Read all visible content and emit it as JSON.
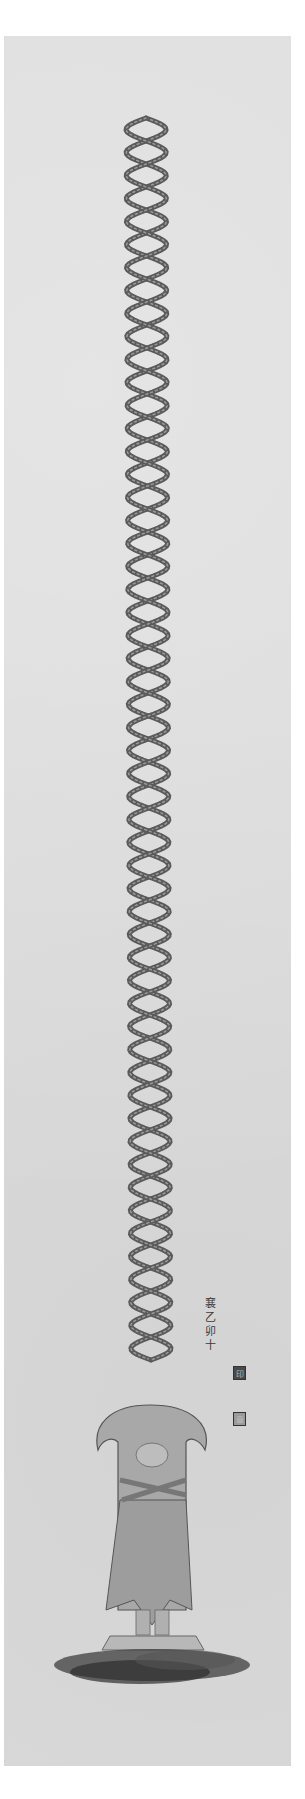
{
  "artwork": {
    "format": "hanging scroll",
    "background_color": "#dcdcdc",
    "ink_color": "#4a4a4a",
    "subject": {
      "helix": {
        "type": "double-helix",
        "turns": 27,
        "x_center": 146,
        "y_start": 118,
        "y_end": 1360
      },
      "figure": {
        "type": "standing robed figure with folded hands on lotus pedestal over ink cloud",
        "x_center": 152,
        "y_top": 1405,
        "y_bottom": 1680
      }
    },
    "inscription": {
      "characters": [
        "㐮",
        "乙",
        "卯",
        "十"
      ],
      "seal_1": "印",
      "seal_2": "章"
    }
  }
}
